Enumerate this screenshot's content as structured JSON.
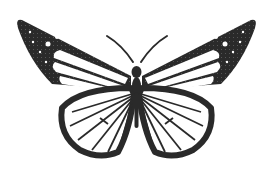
{
  "image": {
    "subject": "butterfly",
    "description": "Black and white illustration of a butterfly with wings spread, dark speckled forewing tips, white cells separated by dark veins",
    "colors": {
      "background": "#ffffff",
      "ink": "#2a2a2a",
      "wing_fill": "#ffffff"
    }
  }
}
